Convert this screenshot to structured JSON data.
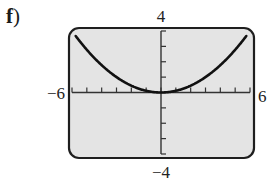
{
  "panel": {
    "label": "f",
    "paren": ")"
  },
  "window": {
    "xmin": -6,
    "xmax": 6,
    "ymin": -4,
    "ymax": 4,
    "xscl": 1,
    "yscl": 1,
    "background": "#e4e4e4",
    "border": "#1e1e1e",
    "curve_color": "#111111"
  },
  "labels": {
    "xmin": "−6",
    "xmax": "6",
    "ymax": "4",
    "ymin": "−4"
  },
  "chart_data": {
    "type": "line",
    "title": "",
    "xlabel": "",
    "ylabel": "",
    "xlim": [
      -6,
      6
    ],
    "ylim": [
      -4,
      4
    ],
    "grid": false,
    "legend": null,
    "tick_labels": {
      "x": [
        "−6",
        "6"
      ],
      "y": [
        "−4",
        "4"
      ]
    },
    "x_ticks": [
      -5,
      -4,
      -3,
      -2,
      -1,
      1,
      2,
      3,
      4,
      5
    ],
    "y_ticks": [
      -3,
      -2,
      -1,
      1,
      2,
      3
    ],
    "series": [
      {
        "name": "y = x^2/9",
        "x": [
          -6,
          -5,
          -4,
          -3,
          -2,
          -1,
          0,
          1,
          2,
          3,
          4,
          5,
          6
        ],
        "y": [
          4,
          2.78,
          1.78,
          1,
          0.44,
          0.11,
          0,
          0.11,
          0.44,
          1,
          1.78,
          2.78,
          4
        ]
      }
    ],
    "annotations": [
      "f)"
    ]
  }
}
